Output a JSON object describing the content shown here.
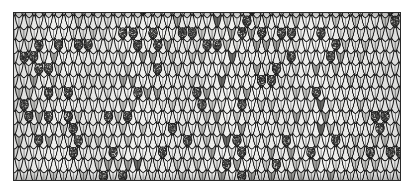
{
  "figure": {
    "kind": "knitting-swatch-illustration",
    "title": "",
    "caption": "",
    "background_color": "#ffffff"
  },
  "panel": {
    "x": 13,
    "y": 12,
    "width": 388,
    "height": 169,
    "border_color": "#2a2a2a",
    "border_width": 1,
    "fill_color": "#f7f7f5"
  },
  "fabric": {
    "stitch_type": "stockinette",
    "stitch_columns": 39,
    "stitch_rows": 14,
    "stitch_width": 9.9,
    "stitch_height": 12.0,
    "yarn_outline_color": "#1f1f1f",
    "yarn_outline_width": 1.0,
    "palette": {
      "white": "#fbfbfa",
      "light_grey": "#e8e8e6",
      "mid_grey": "#cfcfcc",
      "dark_grey": "#a9a9a6",
      "charcoal": "#6e6e6b",
      "speckle_dark": "#2b2b2b",
      "speckle_light": "#d9d9d6"
    },
    "tone_distribution": {
      "white": 0.44,
      "light_grey": 0.21,
      "mid_grey": 0.18,
      "dark_grey": 0.1,
      "charcoal": 0.07
    },
    "speckled_nub_fraction": 0.11,
    "notes": "Marled two-tone yarn; nubs are dense stippled bobbles scattered irregularly across the field"
  },
  "tone_bands": {
    "description": "vertical light/dark banding across the swatch width",
    "stops_percent": [
      0,
      9,
      20,
      31,
      44,
      56,
      68,
      80,
      92,
      100
    ],
    "stop_darkness": [
      0.55,
      0.08,
      0.3,
      0.05,
      0.26,
      0.04,
      0.22,
      0.06,
      0.34,
      0.5
    ]
  }
}
